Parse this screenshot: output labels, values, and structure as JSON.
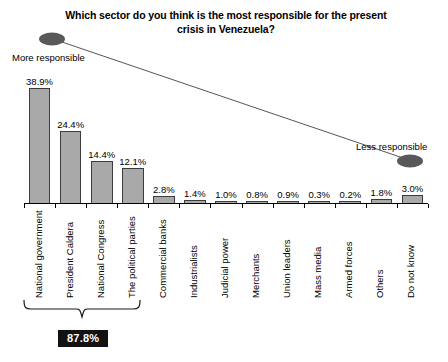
{
  "chart_data": {
    "type": "bar",
    "title": "Which sector do you think is the most responsible for the present crisis in Venezuela?",
    "xlabel": "",
    "ylabel": "",
    "ylim": [
      0,
      40
    ],
    "grid": false,
    "legend": "none",
    "categories": [
      "National government",
      "President Caldera",
      "National Congress",
      "The political parties",
      "Commercial banks",
      "Industrialists",
      "Judicial power",
      "Merchants",
      "Union leaders",
      "Mass media",
      "Armed forces",
      "Others",
      "Do not know"
    ],
    "values": [
      38.9,
      24.4,
      14.4,
      12.1,
      2.8,
      1.4,
      1.0,
      0.8,
      0.9,
      0.3,
      0.2,
      1.8,
      3.0
    ],
    "value_labels": [
      "38.9%",
      "24.4%",
      "14.4%",
      "12.1%",
      "2.8%",
      "1.4%",
      "1.0%",
      "0.8%",
      "0.9%",
      "0.3%",
      "0.2%",
      "1.8%",
      "3.0%"
    ],
    "annotations": {
      "more_responsible": "More responsible",
      "less_responsible": "Less responsible",
      "group_total": "87.8%",
      "group_total_spans": 4
    },
    "colors": {
      "bar_fill": "#a9a9a9",
      "bar_border": "#3c3c3c",
      "marker": "#595959",
      "badge_bg": "#121212",
      "badge_text": "#ffffff",
      "axis": "#000000"
    }
  }
}
